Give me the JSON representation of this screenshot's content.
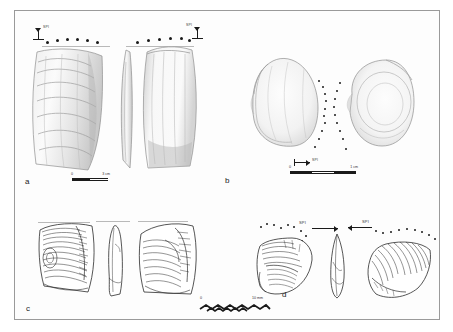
{
  "figure": {
    "kind": "archaeological-plate",
    "background_color": "#ffffff",
    "frame_color": "#9a9a9a",
    "ink_color": "#1a1a1a"
  },
  "panels": [
    {
      "id": "a",
      "letter": "a",
      "style": "shaded-photographic-drawing",
      "description": "Three views of an elongated shell tool with ridged growth lines",
      "markers": {
        "spi_label_left": "SPI",
        "spi_label_right": "SPI",
        "dot_rows": [
          {
            "name": "left-retouch-dots",
            "count": 6
          },
          {
            "name": "right-retouch-dots",
            "count": 6
          }
        ]
      },
      "scale": {
        "zero_label": "0",
        "end_label": "3 cm",
        "segments": 2
      }
    },
    {
      "id": "b",
      "letter": "b",
      "style": "shaded-photographic-drawing",
      "description": "Two opposed rounded shell valves with a central vertical dotted percussion column",
      "markers": {
        "spi_label": "SPI",
        "dot_rows": [
          {
            "name": "central-dot-column-left",
            "count": 9
          },
          {
            "name": "central-dot-column-right",
            "count": 9
          }
        ]
      },
      "scale": {
        "zero_label": "0",
        "end_label": "1 cm",
        "segments": 3
      }
    },
    {
      "id": "c",
      "letter": "c",
      "style": "line-drawing",
      "description": "Three views of a flaked lithic core with concentric flake-scar ripples",
      "markers": {
        "dot_rows": []
      },
      "scale": {
        "zero_label": "",
        "end_label": "",
        "segments": 6,
        "form": "zigzag"
      }
    },
    {
      "id": "d",
      "letter": "d",
      "style": "line-drawing",
      "description": "Three views of a flaked lithic piece with dorsal ripple scars and dotted edge",
      "markers": {
        "spi_label_left": "SPI",
        "spi_label_right": "SPI",
        "dot_rows": [
          {
            "name": "left-edge-dots",
            "count": 11
          },
          {
            "name": "right-edge-dots",
            "count": 9
          }
        ]
      },
      "scale": {
        "zero_label": "0",
        "end_label": "10 mm",
        "segments": 7,
        "form": "zigzag"
      }
    }
  ]
}
